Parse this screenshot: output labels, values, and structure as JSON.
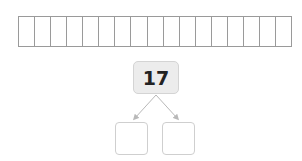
{
  "ten_frame_strip": {
    "cell_count": 17,
    "cells": [
      "",
      "",
      "",
      "",
      "",
      "",
      "",
      "",
      "",
      "",
      "",
      "",
      "",
      "",
      "",
      "",
      ""
    ]
  },
  "number_bond": {
    "whole": "17",
    "parts": [
      "",
      ""
    ]
  },
  "colors": {
    "grid_line": "#9a9a9a",
    "whole_box_fill": "#ececec",
    "part_box_border": "#cfcfcf",
    "arrow": "#b8b8b8"
  }
}
